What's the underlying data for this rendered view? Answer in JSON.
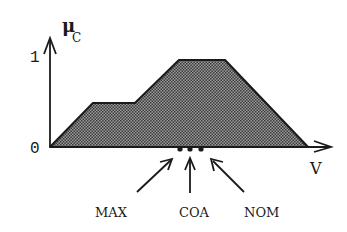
{
  "diagram": {
    "y_axis": {
      "label": "μ",
      "subscript": "C",
      "ticks": [
        "0",
        "1"
      ]
    },
    "x_axis": {
      "label": "V"
    },
    "shape": {
      "type": "piecewise-linear membership area (hatched)",
      "points_norm": [
        [
          0,
          0
        ],
        [
          0.17,
          0.5
        ],
        [
          0.33,
          0.5
        ],
        [
          0.5,
          1
        ],
        [
          0.68,
          1
        ],
        [
          1,
          0
        ]
      ]
    },
    "markers": [
      {
        "label": "MAX",
        "x": 180
      },
      {
        "label": "COA",
        "x": 190
      },
      {
        "label": "NOM",
        "x": 201
      }
    ],
    "colors": {
      "ink": "#1a1a1a",
      "fill": "#777777"
    }
  }
}
